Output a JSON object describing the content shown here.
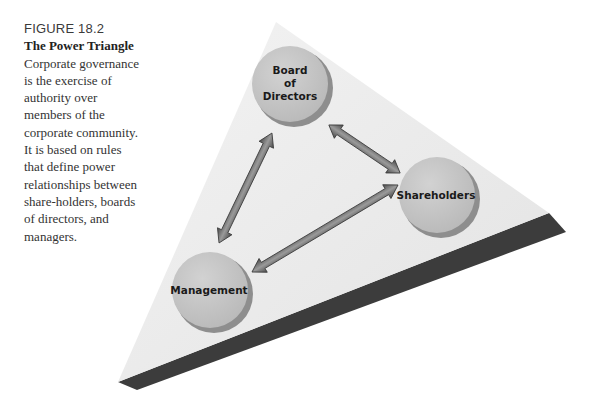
{
  "caption": {
    "figure_label": "FIGURE 18.2",
    "title": "The Power Triangle",
    "body": "Corporate governance is the exercise of authority over members of the corporate community. It is based on rules that define power relationships between share-holders, boards of directors, and managers."
  },
  "diagram": {
    "nodes": {
      "board": {
        "line1": "Board",
        "line2": "of",
        "line3": "Directors"
      },
      "shareholders": {
        "label": "Shareholders"
      },
      "management": {
        "label": "Management"
      }
    },
    "edges": [
      {
        "from": "Board of Directors",
        "to": "Management",
        "type": "bidirectional"
      },
      {
        "from": "Board of Directors",
        "to": "Shareholders",
        "type": "bidirectional"
      },
      {
        "from": "Shareholders",
        "to": "Management",
        "type": "bidirectional"
      }
    ],
    "colors": {
      "triangle_face": "#ebebeb",
      "triangle_edge": "#3c3c3c",
      "circle_fill": "#c4c4c4",
      "circle_shadow": "#8e8e8e",
      "arrow_fill": "#6a6a6a"
    }
  }
}
